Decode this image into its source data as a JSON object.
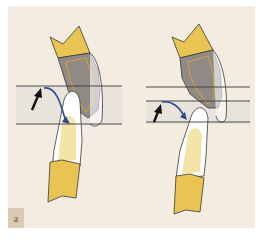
{
  "figure": {
    "panel_label": "a",
    "colors": {
      "background": "#f4ece0",
      "crown_enamel": "#e9c452",
      "tooth_gray": "#8f8a86",
      "pulp_outline": "#d9a23a",
      "root_light": "#f3e4a8",
      "gingiva_band": "#e6e2da",
      "line": "#3a3a3a",
      "curve_arrow": "#2e4c8c",
      "black_arrow": "#111111"
    },
    "left_diagram": {
      "description": "Upper and lower teeth with wide gingival band between two horizontal lines; black arrow pointing up and blue curved arrow"
    },
    "right_diagram": {
      "description": "Upper and lower teeth with three horizontal lines; black arrow and blue curved arrow toward lower tooth"
    }
  }
}
